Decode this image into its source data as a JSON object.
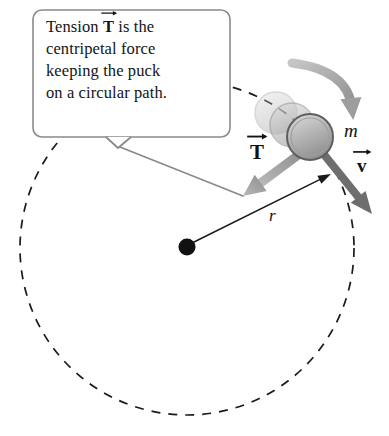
{
  "figure": {
    "width": 389,
    "height": 436,
    "background": "#ffffff"
  },
  "callout": {
    "lines": [
      "Tension",
      "is the",
      "centripetal force",
      "keeping the puck",
      "on a circular path."
    ],
    "symbol": "T",
    "box": {
      "x": 33,
      "y": 10,
      "width": 197,
      "height": 127,
      "corner_radius": 9,
      "stroke": "#8a8a8a",
      "stroke_width": 1.6,
      "fill": "#ffffff"
    },
    "tail": {
      "notch": [
        [
          106,
          137
        ],
        [
          118,
          148
        ],
        [
          131,
          137
        ]
      ],
      "pointer": [
        [
          120,
          147
        ],
        [
          243,
          196
        ]
      ],
      "stroke": "#8a8a8a",
      "stroke_width": 1.8
    }
  },
  "circle_path": {
    "center_x": 187,
    "center_y": 248,
    "radius": 167,
    "stroke": "#1a1a1a",
    "stroke_width": 1.7,
    "dash": "9 8",
    "label": "dashed-circular-path"
  },
  "center_dot": {
    "x": 187,
    "y": 247,
    "radius": 8.5,
    "fill": "#111111"
  },
  "puck": {
    "label": "m",
    "main": {
      "x": 310,
      "y": 137,
      "rx": 23,
      "ry": 23
    },
    "ghosts": [
      {
        "x": 292,
        "y": 125,
        "rx": 22,
        "ry": 22,
        "opacity": 0.55
      },
      {
        "x": 276,
        "y": 113,
        "rx": 21,
        "ry": 21,
        "opacity": 0.35
      }
    ],
    "fill_top": "#cfcfcf",
    "fill_bottom": "#8f8f8f",
    "stroke": "#6b6b6b"
  },
  "vectors": [
    {
      "name": "tension",
      "symbol": "T",
      "bold": true,
      "from": [
        305,
        150
      ],
      "to": [
        243,
        196
      ],
      "color": "#8f8f8f",
      "width": 9,
      "head_length": 22,
      "head_width": 20
    },
    {
      "name": "velocity",
      "symbol": "v",
      "bold": true,
      "from": [
        322,
        152
      ],
      "to": [
        372,
        214
      ],
      "color": "#6e6e6e",
      "width": 8,
      "head_length": 22,
      "head_width": 19
    }
  ],
  "radius_line": {
    "symbol": "r",
    "from": [
      192,
      243
    ],
    "to": [
      331,
      174
    ],
    "color": "#1a1a1a",
    "width": 1.5,
    "head_length": 13,
    "head_width": 9
  },
  "motion_arrow": {
    "name": "direction-of-motion",
    "start": [
      292,
      63
    ],
    "control": [
      348,
      70
    ],
    "end": [
      352,
      108
    ],
    "color": "#9d9d9d",
    "width": 9,
    "head_length": 22,
    "head_width": 21
  }
}
